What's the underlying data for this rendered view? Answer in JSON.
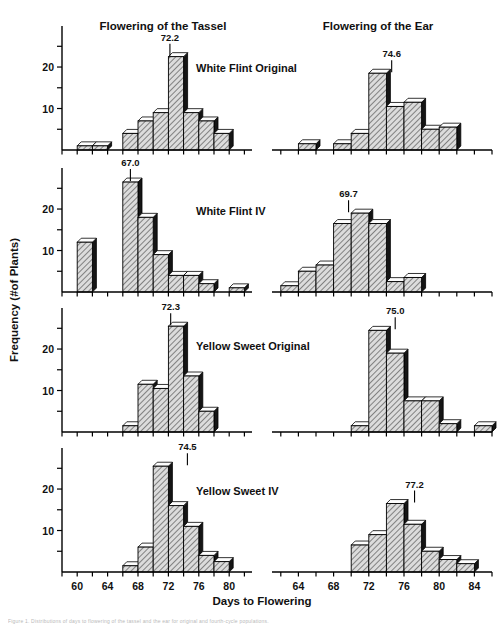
{
  "figure": {
    "column_headers": [
      "Flowering of the Tassel",
      "Flowering of the Ear"
    ],
    "y_axis_label": "Frequency (#of Plants)",
    "x_axis_label": "Days to Flowering",
    "caption": "Figure 1. Distributions of days to flowering of the tassel and the ear for original and fourth-cycle populations."
  },
  "chart_data": {
    "type": "bar",
    "xlabel": "Days to Flowering",
    "ylabel": "Frequency (#of Plants)",
    "ylim": [
      0,
      27
    ],
    "y_ticks": [
      0,
      5,
      10,
      15,
      20,
      25
    ],
    "y_ticks_labeled": [
      10,
      20
    ],
    "grid": false,
    "legend": "none",
    "bin_width": 2,
    "panels": [
      {
        "row": 1,
        "population": "White Flint Original",
        "tassel": {
          "header": "Flowering of the Tassel",
          "mean_label": "72.2",
          "mean_value": 72.2,
          "xlim": [
            58,
            83
          ],
          "x_ticks": [
            58,
            60,
            62,
            64,
            66,
            68,
            70,
            72,
            74,
            76,
            78,
            80,
            82
          ],
          "x_tick_labels": [
            60,
            64,
            68,
            72,
            76,
            80
          ],
          "bin_starts": [
            60,
            62,
            66,
            68,
            70,
            72,
            74,
            76,
            78
          ],
          "values": [
            1,
            1,
            4,
            7,
            9,
            22.5,
            9,
            7,
            4
          ]
        },
        "ear": {
          "header": "Flowering of the Ear",
          "mean_label": "74.6",
          "mean_value": 74.6,
          "xlim": [
            61,
            86
          ],
          "x_ticks": [
            62,
            64,
            66,
            68,
            70,
            72,
            74,
            76,
            78,
            80,
            82,
            84,
            86
          ],
          "x_tick_labels": [
            64,
            68,
            72,
            76,
            80,
            84
          ],
          "bin_starts": [
            64,
            68,
            70,
            72,
            74,
            76,
            78,
            80
          ],
          "values": [
            1.5,
            1.5,
            4,
            18.5,
            10.5,
            11.5,
            5,
            5.5
          ]
        }
      },
      {
        "row": 2,
        "population": "White Flint IV",
        "tassel": {
          "mean_label": "67.0",
          "mean_value": 67.0,
          "xlim": [
            58,
            83
          ],
          "x_ticks": [
            58,
            60,
            62,
            64,
            66,
            68,
            70,
            72,
            74,
            76,
            78,
            80,
            82
          ],
          "x_tick_labels": [
            60,
            64,
            68,
            72,
            76,
            80
          ],
          "bin_starts": [
            60,
            66,
            68,
            70,
            72,
            74,
            76,
            80
          ],
          "values": [
            12,
            26.5,
            18,
            9,
            4,
            4,
            2,
            1
          ]
        },
        "ear": {
          "mean_label": "69.7",
          "mean_value": 69.7,
          "xlim": [
            61,
            86
          ],
          "x_ticks": [
            62,
            64,
            66,
            68,
            70,
            72,
            74,
            76,
            78,
            80,
            82,
            84,
            86
          ],
          "x_tick_labels": [
            64,
            68,
            72,
            76,
            80,
            84
          ],
          "bin_starts": [
            62,
            64,
            66,
            68,
            70,
            72,
            74,
            76
          ],
          "values": [
            1.5,
            5,
            6.5,
            16.5,
            19,
            16.5,
            2.5,
            3.5
          ]
        }
      },
      {
        "row": 3,
        "population": "Yellow Sweet Original",
        "tassel": {
          "mean_label": "72.3",
          "mean_value": 72.3,
          "xlim": [
            58,
            83
          ],
          "x_ticks": [
            58,
            60,
            62,
            64,
            66,
            68,
            70,
            72,
            74,
            76,
            78,
            80,
            82
          ],
          "x_tick_labels": [
            60,
            64,
            68,
            72,
            76,
            80
          ],
          "bin_starts": [
            66,
            68,
            70,
            72,
            74,
            76
          ],
          "values": [
            1.5,
            11.5,
            10.5,
            25.5,
            13.5,
            5
          ]
        },
        "ear": {
          "mean_label": "75.0",
          "mean_value": 75.0,
          "xlim": [
            61,
            86
          ],
          "x_ticks": [
            62,
            64,
            66,
            68,
            70,
            72,
            74,
            76,
            78,
            80,
            82,
            84,
            86
          ],
          "x_tick_labels": [
            64,
            68,
            72,
            76,
            80,
            84
          ],
          "bin_starts": [
            70,
            72,
            74,
            76,
            78,
            80,
            84
          ],
          "values": [
            1.5,
            24.5,
            19,
            7.5,
            7.5,
            2,
            1.5
          ]
        }
      },
      {
        "row": 4,
        "population": "Yellow Sweet IV",
        "tassel": {
          "mean_label": "74.5",
          "mean_value": 74.5,
          "xlim": [
            58,
            83
          ],
          "x_ticks": [
            58,
            60,
            62,
            64,
            66,
            68,
            70,
            72,
            74,
            76,
            78,
            80,
            82
          ],
          "x_tick_labels": [
            60,
            64,
            68,
            72,
            76,
            80
          ],
          "bin_starts": [
            66,
            68,
            70,
            72,
            74,
            76,
            78
          ],
          "values": [
            1.5,
            6,
            25.5,
            16,
            11,
            4,
            2.5
          ]
        },
        "ear": {
          "mean_label": "77.2",
          "mean_value": 77.2,
          "xlim": [
            61,
            86
          ],
          "x_ticks": [
            62,
            64,
            66,
            68,
            70,
            72,
            74,
            76,
            78,
            80,
            82,
            84,
            86
          ],
          "x_tick_labels": [
            64,
            68,
            72,
            76,
            80,
            84
          ],
          "bin_starts": [
            70,
            72,
            74,
            76,
            78,
            80,
            82
          ],
          "values": [
            6.5,
            9,
            16.5,
            11.5,
            5,
            3,
            2
          ]
        }
      }
    ]
  }
}
